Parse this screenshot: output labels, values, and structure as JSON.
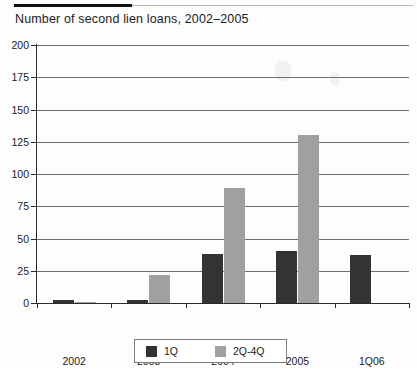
{
  "chart_data": {
    "type": "bar",
    "title": "Number of second lien loans, 2002–2005",
    "xlabel": "",
    "ylabel": "",
    "ylim": [
      0,
      200
    ],
    "yticks": [
      0,
      25,
      50,
      75,
      100,
      125,
      150,
      175,
      200
    ],
    "ytick_labels": [
      "0",
      "25",
      "50",
      "75",
      "100",
      "125",
      "150",
      "175",
      "200"
    ],
    "grid": true,
    "legend_position": "bottom-center",
    "categories": [
      "2002",
      "2003",
      "2004",
      "2005",
      "1Q06"
    ],
    "series": [
      {
        "name": "1Q",
        "color": "#333333",
        "values": [
          2,
          2,
          38,
          40,
          37
        ]
      },
      {
        "name": "2Q-4Q",
        "color": "#a0a0a0",
        "values": [
          1,
          22,
          89,
          130,
          0
        ]
      }
    ]
  },
  "legend": {
    "entries": [
      {
        "label": "1Q",
        "color": "#333333",
        "swatch": "legend-swatch-1q"
      },
      {
        "label": "2Q-4Q",
        "color": "#a0a0a0",
        "swatch": "legend-swatch-2q4q"
      }
    ]
  },
  "colors": {
    "series_1q": "#333333",
    "series_2q4q": "#a0a0a0",
    "axis": "#2a2a2a",
    "gridline": "#6f6f6f",
    "text": "#1b1b1b",
    "background": "#fdfdfd"
  }
}
